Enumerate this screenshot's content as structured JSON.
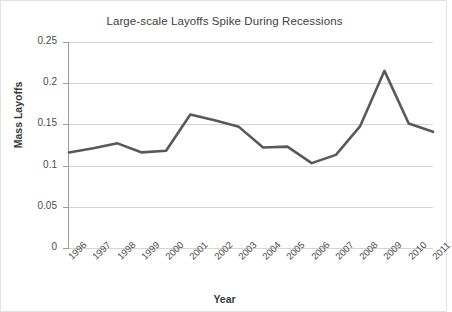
{
  "chart_data": {
    "type": "line",
    "title": "Large-scale Layoffs Spike During Recessions",
    "xlabel": "Year",
    "ylabel": "Mass Layoffs",
    "categories": [
      "1996",
      "1997",
      "1998",
      "1999",
      "2000",
      "2001",
      "2002",
      "2003",
      "2004",
      "2005",
      "2006",
      "2007",
      "2008",
      "2009",
      "2010",
      "2011"
    ],
    "values": [
      0.116,
      0.121,
      0.127,
      0.116,
      0.118,
      0.162,
      0.155,
      0.147,
      0.122,
      0.123,
      0.103,
      0.113,
      0.148,
      0.215,
      0.151,
      0.141
    ],
    "series": [
      {
        "name": "Mass Layoffs",
        "values": [
          0.116,
          0.121,
          0.127,
          0.116,
          0.118,
          0.162,
          0.155,
          0.147,
          0.122,
          0.123,
          0.103,
          0.113,
          0.148,
          0.215,
          0.151,
          0.141
        ],
        "color": "#595959"
      }
    ],
    "ylim": [
      0,
      0.25
    ],
    "yticks": [
      "0",
      "0.05",
      "0.1",
      "0.15",
      "0.2",
      "0.25"
    ],
    "ytick_values": [
      0,
      0.05,
      0.1,
      0.15,
      0.2,
      0.25
    ],
    "grid": true,
    "grid_color": "#d4d4d4",
    "legend": "none",
    "legend_position": "none",
    "background": "#ffffff",
    "axis_color": "#9d9d9d",
    "text_color": "#404040"
  }
}
